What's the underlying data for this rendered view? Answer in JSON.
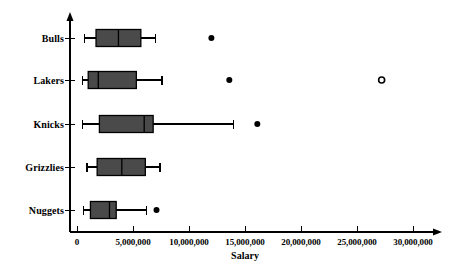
{
  "chart_data": {
    "type": "box",
    "title": "",
    "xlabel": "Salary",
    "ylabel": "",
    "xlim": [
      0,
      30000000
    ],
    "ylim_categories": [
      "Bulls",
      "Lakers",
      "Knicks",
      "Grizzlies",
      "Nuggets"
    ],
    "grid": false,
    "legend": null,
    "orientation": "horizontal",
    "xticks": [
      0,
      5000000,
      10000000,
      15000000,
      20000000,
      25000000,
      30000000
    ],
    "xtick_labels": [
      "0",
      "5,000,000",
      "10,000,000",
      "15,000,000",
      "20,000,000",
      "25,000,000",
      "30,000,000"
    ],
    "categories": [
      "Bulls",
      "Lakers",
      "Knicks",
      "Grizzlies",
      "Nuggets"
    ],
    "boxes": [
      {
        "label": "Bulls",
        "whisker_low": 700000,
        "q1": 1700000,
        "median": 3700000,
        "q3": 5700000,
        "whisker_high": 7000000,
        "outliers": [
          12000000
        ],
        "outlier_styles": [
          "filled"
        ]
      },
      {
        "label": "Lakers",
        "whisker_low": 500000,
        "q1": 1000000,
        "median": 1900000,
        "q3": 5300000,
        "whisker_high": 7600000,
        "outliers": [
          13600000,
          27200000
        ],
        "outlier_styles": [
          "filled",
          "open"
        ]
      },
      {
        "label": "Knicks",
        "whisker_low": 500000,
        "q1": 2000000,
        "median": 6000000,
        "q3": 6800000,
        "whisker_high": 14000000,
        "outliers": [
          16100000
        ],
        "outlier_styles": [
          "filled"
        ]
      },
      {
        "label": "Grizzlies",
        "whisker_low": 900000,
        "q1": 1800000,
        "median": 4000000,
        "q3": 6100000,
        "whisker_high": 7400000,
        "outliers": [],
        "outlier_styles": []
      },
      {
        "label": "Nuggets",
        "whisker_low": 600000,
        "q1": 1200000,
        "median": 2900000,
        "q3": 3500000,
        "whisker_high": 6200000,
        "outliers": [
          7100000
        ],
        "outlier_styles": [
          "filled"
        ]
      }
    ]
  },
  "style": {
    "box_fill": "#4a4a4a",
    "box_stroke": "#000000",
    "axis_color": "#000000",
    "marker_color": "#000000",
    "background": "#ffffff"
  },
  "geometry": {
    "axis_x": 70,
    "axis_baseline_y": 232,
    "axis_top_y": 14,
    "axis_right_x": 440,
    "x0_px": 77,
    "px_per_million": 11.2,
    "row_y": [
      38,
      80,
      124,
      167,
      210
    ],
    "box_height": 17,
    "ylabel_x": 64,
    "xtick_label_y": 237,
    "axis_title_x": 245,
    "axis_title_y": 250
  }
}
